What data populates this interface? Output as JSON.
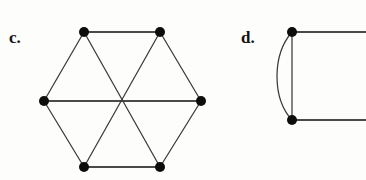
{
  "figure": {
    "background_color": "#fdfdfc",
    "ink_color": "#0d0d0d",
    "edge_color": "#3b3b3b",
    "width": 366,
    "height": 180,
    "panels": [
      {
        "id": "c",
        "label": "c.",
        "label_position": {
          "x": 9,
          "y": 29
        },
        "graph_type": "simple-graph",
        "description": "hexagon with three long diagonals",
        "vertex_count": 6,
        "edge_count": 9,
        "vertices": [
          {
            "id": "v1",
            "name": "top-left",
            "cx": 84,
            "cy": 32,
            "r": 5.0
          },
          {
            "id": "v2",
            "name": "top-right",
            "cx": 160,
            "cy": 32,
            "r": 5.0
          },
          {
            "id": "v3",
            "name": "right-middle",
            "cx": 201,
            "cy": 101,
            "r": 5.0
          },
          {
            "id": "v4",
            "name": "bottom-right",
            "cx": 160,
            "cy": 167,
            "r": 5.0
          },
          {
            "id": "v5",
            "name": "bottom-left",
            "cx": 84,
            "cy": 167,
            "r": 5.0
          },
          {
            "id": "v6",
            "name": "left-middle",
            "cx": 44,
            "cy": 101,
            "r": 5.0
          }
        ],
        "edges": [
          {
            "from": "v1",
            "to": "v2",
            "kind": "perimeter-top",
            "style": "thick"
          },
          {
            "from": "v2",
            "to": "v3",
            "kind": "perimeter-upper-right",
            "style": "thin"
          },
          {
            "from": "v3",
            "to": "v4",
            "kind": "perimeter-lower-right",
            "style": "thin"
          },
          {
            "from": "v4",
            "to": "v5",
            "kind": "perimeter-bottom",
            "style": "thick"
          },
          {
            "from": "v5",
            "to": "v6",
            "kind": "perimeter-lower-left",
            "style": "thin"
          },
          {
            "from": "v6",
            "to": "v1",
            "kind": "perimeter-upper-left",
            "style": "thin"
          },
          {
            "from": "v6",
            "to": "v3",
            "kind": "diagonal-horizontal",
            "style": "thick"
          },
          {
            "from": "v1",
            "to": "v4",
            "kind": "diagonal-descending",
            "style": "thin"
          },
          {
            "from": "v2",
            "to": "v5",
            "kind": "diagonal-ascending",
            "style": "thin"
          }
        ],
        "crossing_point": {
          "x": 122,
          "y": 101
        }
      },
      {
        "id": "d",
        "label": "d.",
        "label_position": {
          "x": 241,
          "y": 29
        },
        "graph_type": "multigraph",
        "description": "two vertices joined by a straight edge and a parallel curved edge, with two horizontal edges leaving the cropped right border",
        "vertex_count": 2,
        "edge_count": 4,
        "vertices": [
          {
            "id": "w1",
            "name": "upper",
            "cx": 292,
            "cy": 32,
            "r": 5.0
          },
          {
            "id": "w2",
            "name": "lower",
            "cx": 292,
            "cy": 120,
            "r": 5.0
          }
        ],
        "edges": [
          {
            "from": "w1",
            "to": "w2",
            "kind": "straight-vertical",
            "style": "thin",
            "path": "M 292 32 L 292 120"
          },
          {
            "from": "w1",
            "to": "w2",
            "kind": "curved-parallel",
            "style": "thin",
            "path": "M 292 32 C 272 55, 272 98, 292 120"
          },
          {
            "from": "w1",
            "to": "cropped-right",
            "kind": "horizontal-top-cropped",
            "style": "thick",
            "path": "M 292 32 L 366 32"
          },
          {
            "from": "w2",
            "to": "cropped-right",
            "kind": "horizontal-bottom-cropped",
            "style": "thick",
            "path": "M 292 120 L 366 120"
          }
        ]
      }
    ]
  }
}
